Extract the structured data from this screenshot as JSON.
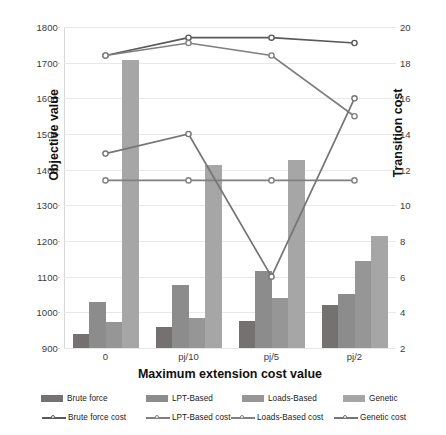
{
  "chart_data": {
    "type": "bar",
    "title": "",
    "xlabel": "Maximum extension cost value",
    "ylabel": "Objective value",
    "ylabel_secondary": "Transition cost",
    "categories": [
      "0",
      "pj/10",
      "pj/5",
      "pj/2"
    ],
    "ylim": [
      900,
      1800
    ],
    "yticks": [
      900,
      1000,
      1100,
      1200,
      1300,
      1400,
      1500,
      1600,
      1700,
      1800
    ],
    "ylim_secondary": [
      2,
      20
    ],
    "yticks_secondary": [
      2,
      4,
      6,
      8,
      10,
      12,
      14,
      16,
      18,
      20
    ],
    "grid": true,
    "legend_position": "bottom",
    "series": [
      {
        "name": "Brute force",
        "kind": "bar",
        "axis": "left",
        "color": "#767171",
        "values": [
          940,
          960,
          975,
          1020
        ]
      },
      {
        "name": "LPT-Based",
        "kind": "bar",
        "axis": "left",
        "color": "#8C8C8C",
        "values": [
          1030,
          1078,
          1115,
          1052
        ]
      },
      {
        "name": "Loads-Based",
        "kind": "bar",
        "axis": "left",
        "color": "#969696",
        "values": [
          972,
          983,
          1040,
          1145
        ]
      },
      {
        "name": "Genetic",
        "kind": "bar",
        "axis": "left",
        "color": "#A6A6A6",
        "values": [
          1708,
          1412,
          1428,
          1213
        ]
      },
      {
        "name": "Brute force cost",
        "kind": "line",
        "axis": "right",
        "color": "#595959",
        "values": [
          18.4,
          19.4,
          19.4,
          19.1
        ]
      },
      {
        "name": "LPT-Based cost",
        "kind": "line",
        "axis": "right",
        "color": "#7F7F7F",
        "values": [
          18.4,
          19.1,
          18.4,
          15.0
        ]
      },
      {
        "name": "Loads-Based cost",
        "kind": "line",
        "axis": "right",
        "color": "#808080",
        "values": [
          11.4,
          11.4,
          11.4,
          11.4
        ]
      },
      {
        "name": "Genetic cost",
        "kind": "line",
        "axis": "right",
        "color": "#757575",
        "values": [
          12.9,
          14.0,
          6.0,
          16.0
        ]
      }
    ]
  },
  "legend": {
    "bars": [
      "Brute force",
      "LPT-Based",
      "Loads-Based",
      "Genetic"
    ],
    "lines": [
      "Brute force cost",
      "LPT-Based cost",
      "Loads-Based cost",
      "Genetic cost"
    ]
  },
  "colors": {
    "grid": "#E8E8E8",
    "axis": "#BFBFBF",
    "text": "#1A1A1A"
  }
}
